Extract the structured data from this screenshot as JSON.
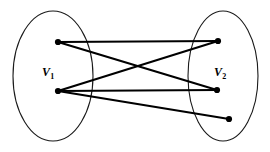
{
  "figure": {
    "name": "bipartite-graph",
    "caption_text": "",
    "background_color": "#ffffff",
    "stroke_color": "#000000",
    "outline_color": "#1a1a1a",
    "width": 270,
    "height": 152
  },
  "sets": [
    {
      "id": "V1",
      "label_main": "V",
      "label_sub": "1",
      "ellipse": {
        "cx": 53,
        "cy": 76,
        "rx": 40,
        "ry": 65
      }
    },
    {
      "id": "V2",
      "label_main": "V",
      "label_sub": "2",
      "ellipse": {
        "cx": 223,
        "cy": 76,
        "rx": 35,
        "ry": 65
      }
    }
  ],
  "vertices": [
    {
      "id": "a1",
      "set": "V1",
      "cx": 58,
      "cy": 42,
      "r": 3.1
    },
    {
      "id": "a2",
      "set": "V1",
      "cx": 58,
      "cy": 91,
      "r": 3.1
    },
    {
      "id": "b1",
      "set": "V2",
      "cx": 218,
      "cy": 41,
      "r": 3.1
    },
    {
      "id": "b2",
      "set": "V2",
      "cx": 217,
      "cy": 90,
      "r": 3.1
    },
    {
      "id": "b3",
      "set": "V2",
      "cx": 229,
      "cy": 119,
      "r": 3.1
    }
  ],
  "edges": [
    {
      "id": "e1",
      "from": "a1",
      "to": "b1",
      "x1": 58,
      "y1": 42,
      "x2": 218,
      "y2": 41
    },
    {
      "id": "e2",
      "from": "a1",
      "to": "b2",
      "x1": 58,
      "y1": 42,
      "x2": 217,
      "y2": 90
    },
    {
      "id": "e3",
      "from": "a2",
      "to": "b1",
      "x1": 58,
      "y1": 91,
      "x2": 218,
      "y2": 41
    },
    {
      "id": "e4",
      "from": "a2",
      "to": "b2",
      "x1": 58,
      "y1": 91,
      "x2": 217,
      "y2": 90
    },
    {
      "id": "e5",
      "from": "a2",
      "to": "b3",
      "x1": 58,
      "y1": 91,
      "x2": 229,
      "y2": 119
    }
  ]
}
